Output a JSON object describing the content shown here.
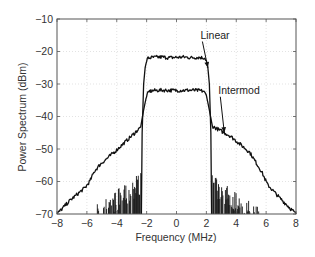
{
  "chart_data": {
    "type": "line",
    "title": "",
    "xlabel": "Frequency (MHz)",
    "ylabel": "Power Spectrum (dBm)",
    "xlim": [
      -8,
      8
    ],
    "ylim": [
      -70,
      -10
    ],
    "xticks": [
      -8,
      -6,
      -4,
      -2,
      0,
      2,
      4,
      6,
      8
    ],
    "yticks": [
      -10,
      -20,
      -30,
      -40,
      -50,
      -60,
      -70
    ],
    "xtick_labels": [
      "−8",
      "−6",
      "−4",
      "−2",
      "0",
      "2",
      "4",
      "6",
      "8"
    ],
    "ytick_labels": [
      "−10",
      "−20",
      "−30",
      "−40",
      "−50",
      "−60",
      "−70"
    ],
    "grid": true,
    "legend": "none",
    "series": [
      {
        "name": "Linear",
        "x": [
          -2.35,
          -2.3,
          -2.2,
          -2.1,
          -2.0,
          -1.9,
          -1.5,
          -1.0,
          -0.5,
          0,
          0.5,
          1.0,
          1.5,
          1.9,
          2.0,
          2.1,
          2.2,
          2.3,
          2.35
        ],
        "y": [
          -70,
          -45,
          -30,
          -25,
          -22.8,
          -22.0,
          -21.8,
          -21.7,
          -21.9,
          -21.8,
          -21.7,
          -21.9,
          -21.8,
          -22.0,
          -22.8,
          -25,
          -30,
          -45,
          -70
        ],
        "noise_floor_left": {
          "x_range": [
            -5.3,
            -2.35
          ],
          "y_range": [
            -67,
            -57
          ]
        },
        "noise_floor_right": {
          "x_range": [
            2.35,
            5.5
          ],
          "y_range": [
            -57,
            -68
          ]
        }
      },
      {
        "name": "Intermod",
        "x": [
          -8,
          -7.1,
          -6.1,
          -5.8,
          -5.5,
          -5.1,
          -4.1,
          -3.1,
          -2.4,
          -2.2,
          -2.0,
          -1.8,
          -1.5,
          -1.0,
          0,
          1.0,
          1.5,
          1.8,
          2.0,
          2.2,
          2.4,
          3.6,
          4.9,
          5.7,
          6.1,
          6.9,
          8
        ],
        "y": [
          -70,
          -65.7,
          -61.8,
          -59.9,
          -56.9,
          -54.7,
          -50.7,
          -46.4,
          -43.3,
          -38,
          -33.5,
          -32.2,
          -32.0,
          -31.9,
          -32.0,
          -31.9,
          -32.0,
          -32.2,
          -33.5,
          -38,
          -43,
          -46,
          -51,
          -57,
          -61,
          -65,
          -70
        ]
      }
    ],
    "annotations": [
      {
        "text": "Linear",
        "text_x": 1.6,
        "text_y": -16,
        "arrow_to_x": 2.1,
        "arrow_to_y": -25
      },
      {
        "text": "Intermod",
        "text_x": 2.8,
        "text_y": -33,
        "arrow_to_x": 3.2,
        "arrow_to_y": -45
      }
    ]
  },
  "colors": {
    "line": "#111111",
    "axis": "#555555",
    "grid": "#d0d0d0",
    "text": "#333333"
  }
}
